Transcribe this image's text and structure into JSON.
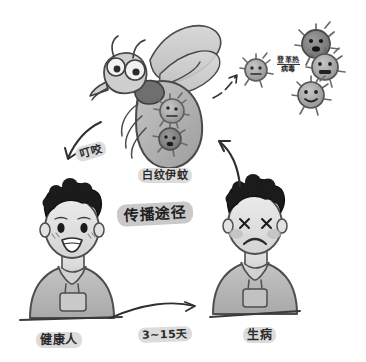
{
  "diagram": {
    "title_style": "hand-drawn grayscale sketch",
    "background_color": "#ffffff",
    "ink_color": "#2b2b2b",
    "fill_gray": "#b5b5b5",
    "chip_gray": "#c9c9c9"
  },
  "labels": {
    "mosquito": "白纹伊蚊",
    "route": "传播途径",
    "bite": "叮咬",
    "virus_line1": "登革热",
    "virus_line2": "病毒",
    "healthy_person": "健康人",
    "sick_person": "生病",
    "incubation": "3~15天"
  },
  "nodes": {
    "mosquito": {
      "name": "白纹伊蚊",
      "description": "cartoon mosquito carrying virus particles in abdomen"
    },
    "healthy_person": {
      "name": "健康人",
      "expression": "smiling",
      "description": "happy person with curly black hair wearing hoodie"
    },
    "sick_person": {
      "name": "生病",
      "expression": "x-eyes frowning",
      "description": "ill person with curly black hair wearing hoodie"
    },
    "virus_cluster": {
      "name": "登革热病毒",
      "count": 4
    }
  },
  "arrows": [
    {
      "id": "mosquito-to-healthy",
      "label": "叮咬",
      "from": "白纹伊蚊",
      "to": "健康人"
    },
    {
      "id": "sick-to-mosquito",
      "label": "",
      "from": "生病",
      "to": "白纹伊蚊"
    },
    {
      "id": "mosquito-to-virus",
      "label": "登革热病毒",
      "from": "白纹伊蚊",
      "to": "病毒"
    },
    {
      "id": "healthy-to-sick",
      "label": "3~15天",
      "from": "健康人",
      "to": "生病"
    }
  ]
}
